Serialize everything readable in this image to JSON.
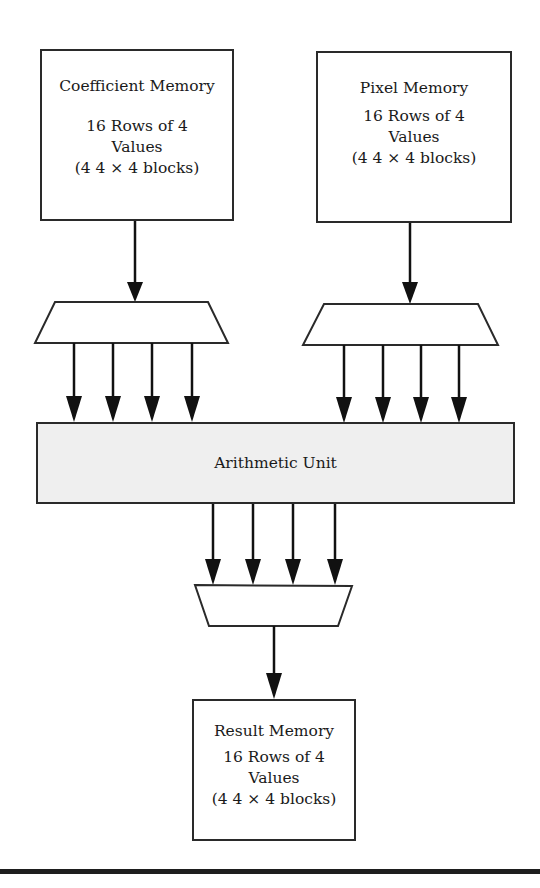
{
  "diagram": {
    "type": "block-diagram",
    "blocks": {
      "coefficient_memory": {
        "title": "Coefficient Memory",
        "line1": "16 Rows of 4",
        "line2": "Values",
        "line3": "(4 4 × 4 blocks)"
      },
      "pixel_memory": {
        "title": "Pixel Memory",
        "line1": "16 Rows of 4",
        "line2": "Values",
        "line3": "(4 4 × 4 blocks)"
      },
      "arithmetic_unit": {
        "label": "Arithmetic Unit",
        "fill_color": "#efefef"
      },
      "result_memory": {
        "title": "Result Memory",
        "line1": "16 Rows of 4",
        "line2": "Values",
        "line3": "(4 4 × 4 blocks)"
      }
    },
    "connections": [
      {
        "from": "coefficient_memory",
        "to": "left_demux",
        "count": 1
      },
      {
        "from": "left_demux",
        "to": "arithmetic_unit",
        "count": 4
      },
      {
        "from": "pixel_memory",
        "to": "right_demux",
        "count": 1
      },
      {
        "from": "right_demux",
        "to": "arithmetic_unit",
        "count": 4
      },
      {
        "from": "arithmetic_unit",
        "to": "output_mux",
        "count": 4
      },
      {
        "from": "output_mux",
        "to": "result_memory",
        "count": 1
      }
    ]
  }
}
